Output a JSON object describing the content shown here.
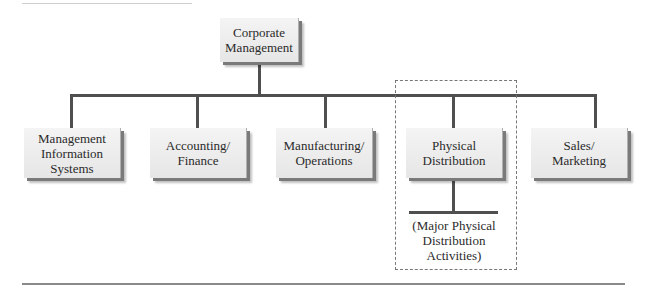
{
  "diagram": {
    "type": "org-chart",
    "root": {
      "label": "Corporate\nManagement"
    },
    "departments": [
      {
        "label": "Management\nInformation\nSystems"
      },
      {
        "label": "Accounting/\nFinance"
      },
      {
        "label": "Manufacturing/\nOperations"
      },
      {
        "label": "Physical\nDistribution",
        "highlighted": true
      },
      {
        "label": "Sales/\nMarketing"
      }
    ],
    "highlight_note": {
      "label": "(Major Physical\nDistribution\nActivities)"
    },
    "colors": {
      "connector": "#4f4f4f",
      "box_fill": "#eeeeee",
      "dashed_border": "#777777"
    }
  }
}
